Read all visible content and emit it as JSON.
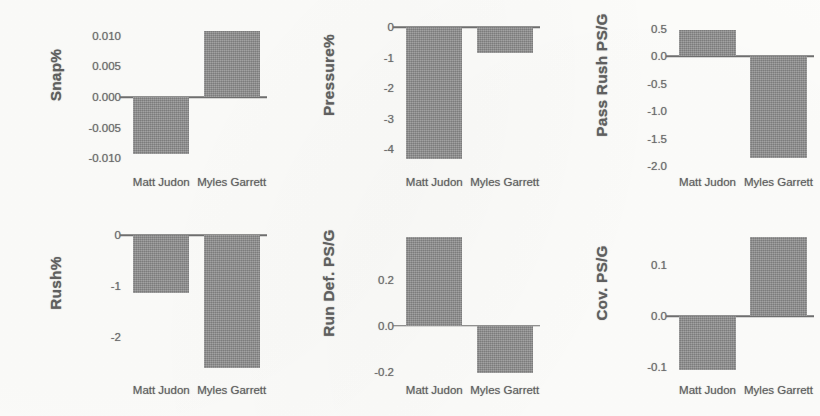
{
  "figure": {
    "categories": [
      "Matt Judon",
      "Myles Garrett"
    ],
    "bar_color": "#8d8d8d",
    "background_color": "#fdfdfb",
    "axis_color": "#6e6e6e",
    "text_color": "#5f5f5f"
  },
  "chart_data": [
    {
      "type": "bar",
      "title": "",
      "ylabel": "Snap%",
      "xlabel": "",
      "categories": [
        "Matt Judon",
        "Myles Garrett"
      ],
      "values": [
        -0.0092,
        0.0108
      ],
      "ylim": [
        -0.0122,
        0.0122
      ],
      "yticks": [
        0.01,
        0.005,
        0.0,
        -0.005,
        -0.01
      ],
      "yticklabels": [
        "0.010",
        "0.005",
        "0.000",
        "-0.005",
        "-0.010"
      ],
      "grid": false,
      "legend": "none"
    },
    {
      "type": "bar",
      "title": "",
      "ylabel": "Pressure%",
      "xlabel": "",
      "categories": [
        "Matt Judon",
        "Myles Garrett"
      ],
      "values": [
        -4.32,
        -0.85
      ],
      "ylim": [
        -4.75,
        0.18
      ],
      "yticks": [
        0,
        -1,
        -2,
        -3,
        -4
      ],
      "yticklabels": [
        "0",
        "-1",
        "-2",
        "-3",
        "-4"
      ],
      "grid": false,
      "legend": "none"
    },
    {
      "type": "bar",
      "title": "",
      "ylabel": "Pass Rush PS/G",
      "xlabel": "",
      "categories": [
        "Matt Judon",
        "Myles Garrett"
      ],
      "values": [
        0.47,
        -1.85
      ],
      "ylim": [
        -2.1,
        0.62
      ],
      "yticks": [
        0.5,
        0.0,
        -0.5,
        -1.0,
        -1.5,
        -2.0
      ],
      "yticklabels": [
        "0.5",
        "0.0",
        "-0.5",
        "-1.0",
        "-1.5",
        "-2.0"
      ],
      "grid": false,
      "legend": "none"
    },
    {
      "type": "bar",
      "title": "",
      "ylabel": "Rush%",
      "xlabel": "",
      "categories": [
        "Matt Judon",
        "Myles Garrett"
      ],
      "values": [
        -1.13,
        -2.62
      ],
      "ylim": [
        -2.85,
        0.1
      ],
      "yticks": [
        0,
        -1,
        -2
      ],
      "yticklabels": [
        "0",
        "-1",
        "-2"
      ],
      "grid": false,
      "legend": "none"
    },
    {
      "type": "bar",
      "title": "",
      "ylabel": "Run Def. PS/G",
      "xlabel": "",
      "categories": [
        "Matt Judon",
        "Myles Garrett"
      ],
      "values": [
        0.385,
        -0.205
      ],
      "ylim": [
        -0.235,
        0.415
      ],
      "yticks": [
        0.2,
        0.0,
        -0.2
      ],
      "yticklabels": [
        "0.2",
        "0.0",
        "-0.2"
      ],
      "grid": false,
      "legend": "none"
    },
    {
      "type": "bar",
      "title": "",
      "ylabel": "Cov. PS/G",
      "xlabel": "",
      "categories": [
        "Matt Judon",
        "Myles Garrett"
      ],
      "values": [
        -0.105,
        0.155
      ],
      "ylim": [
        -0.125,
        0.168
      ],
      "yticks": [
        0.1,
        0.0,
        -0.1
      ],
      "yticklabels": [
        "0.1",
        "0.0",
        "-0.1"
      ],
      "grid": false,
      "legend": "none"
    }
  ]
}
